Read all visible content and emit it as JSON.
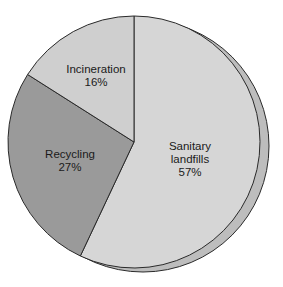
{
  "chart_data": {
    "type": "pie",
    "title": "",
    "categories": [
      "Sanitary landfills",
      "Recycling",
      "Incineration"
    ],
    "values": [
      57,
      27,
      16
    ],
    "unit": "%",
    "slices": [
      {
        "label": "Sanitary landfills",
        "line1": "Sanitary",
        "line2": "landfills",
        "value": 57,
        "value_label": "57%",
        "color": "#d6d6d6"
      },
      {
        "label": "Recycling",
        "line1": "Recycling",
        "line2": "",
        "value": 27,
        "value_label": "27%",
        "color": "#9a9a9a"
      },
      {
        "label": "Incineration",
        "line1": "Incineration",
        "line2": "",
        "value": 16,
        "value_label": "16%",
        "color": "#cfcfcf"
      }
    ],
    "start_angle_deg": 0,
    "direction": "clockwise",
    "legend": "none",
    "style": "3d-offset-shadow"
  },
  "colors": {
    "outline": "#2a2a2a",
    "shadow": "#bdbdbd",
    "background": "#ffffff"
  }
}
